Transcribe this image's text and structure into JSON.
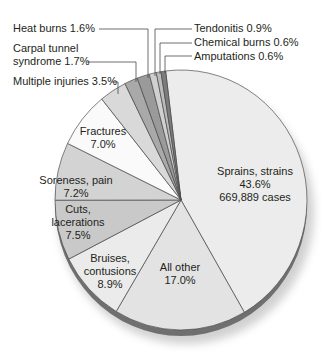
{
  "chart_data": {
    "type": "pie",
    "title": "",
    "style": "3D tilted pie, grayscale",
    "slices": [
      {
        "label": "Sprains, strains",
        "value": 43.6,
        "cases": "669,889 cases",
        "color": "#ececec"
      },
      {
        "label": "All other",
        "value": 17.0,
        "color": "#e3e3e3"
      },
      {
        "label": "Bruises, contusions",
        "value": 8.9,
        "color": "#ebebeb"
      },
      {
        "label": "Cuts, lacerations",
        "value": 7.5,
        "color": "#c9c9c9"
      },
      {
        "label": "Soreness, pain",
        "value": 7.2,
        "color": "#d3d3d3"
      },
      {
        "label": "Fractures",
        "value": 7.0,
        "color": "#fafafa"
      },
      {
        "label": "Multiple injuries",
        "value": 3.5,
        "color": "#d9d9d9"
      },
      {
        "label": "Carpal tunnel syndrome",
        "value": 1.7,
        "color": "#a9a9a9"
      },
      {
        "label": "Heat burns",
        "value": 1.6,
        "color": "#9a9a9a"
      },
      {
        "label": "Tendonitis",
        "value": 0.9,
        "color": "#d0d0d0"
      },
      {
        "label": "Chemical burns",
        "value": 0.6,
        "color": "#bcbcbc"
      },
      {
        "label": "Amputations",
        "value": 0.6,
        "color": "#7c7c7c"
      }
    ]
  },
  "labels": {
    "sprains": {
      "line1": "Sprains, strains",
      "line2": "43.6%",
      "line3": "669,889 cases"
    },
    "all_other": {
      "line1": "All other",
      "line2": "17.0%"
    },
    "bruises": {
      "line1": "Bruises,",
      "line2": "contusions",
      "line3": "8.9%"
    },
    "cuts": {
      "line1": "Cuts,",
      "line2": "lacerations",
      "line3": "7.5%"
    },
    "soreness": {
      "line1": "Soreness, pain",
      "line2": "7.2%"
    },
    "fractures": {
      "line1": "Fractures",
      "line2": "7.0%"
    },
    "multiple": "Multiple injuries 3.5%",
    "carpal": {
      "line1": "Carpal tunnel",
      "line2": "syndrome 1.7%"
    },
    "heat": "Heat burns 1.6%",
    "tendonitis": "Tendonitis 0.9%",
    "chemical": "Chemical burns 0.6%",
    "amputations": "Amputations 0.6%"
  }
}
